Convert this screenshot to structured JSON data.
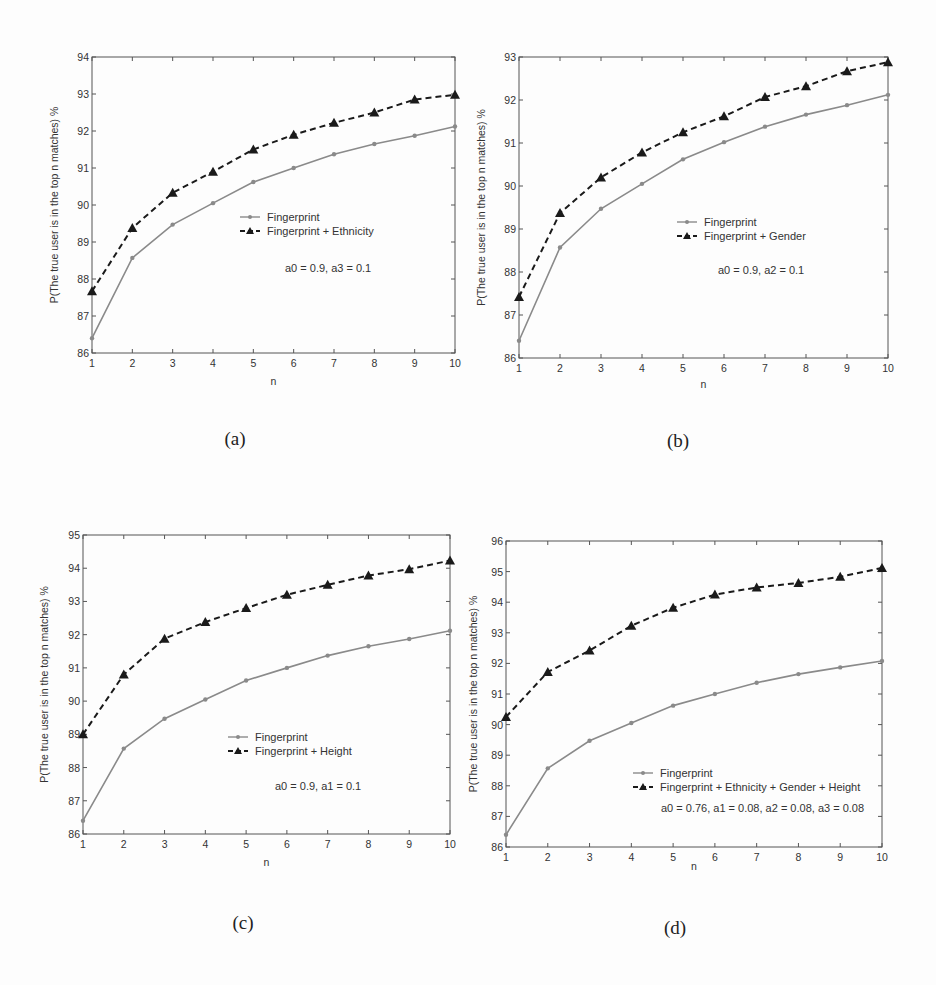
{
  "figure": {
    "panels": [
      {
        "id": "a",
        "caption": "(a)"
      },
      {
        "id": "b",
        "caption": "(b)"
      },
      {
        "id": "c",
        "caption": "(c)"
      },
      {
        "id": "d",
        "caption": "(d)"
      }
    ]
  },
  "colors": {
    "fingerprint": "#8a8a8a",
    "combined": "#1a1a1a",
    "axis": "#555555"
  },
  "chart_data": [
    {
      "type": "line",
      "panel": "(a)",
      "title": "",
      "xlabel": "n",
      "ylabel": "P(The true user is in the top n matches) %",
      "x": [
        1,
        2,
        3,
        4,
        5,
        6,
        7,
        8,
        9,
        10
      ],
      "xlim": [
        1,
        10
      ],
      "ylim": [
        86,
        94
      ],
      "yticks": [
        86,
        87,
        88,
        89,
        90,
        91,
        92,
        93,
        94
      ],
      "grid": false,
      "legend_position": "center-right",
      "annotation": "a0 = 0.9, a3 = 0.1",
      "series": [
        {
          "name": "Fingerprint",
          "style": "solid-gray-circle",
          "values": [
            86.4,
            88.57,
            89.47,
            90.05,
            90.62,
            91.0,
            91.37,
            91.65,
            91.87,
            92.12
          ]
        },
        {
          "name": "Fingerprint + Ethnicity",
          "style": "dashed-black-triangle",
          "values": [
            87.67,
            89.38,
            90.33,
            90.9,
            91.5,
            91.9,
            92.22,
            92.5,
            92.85,
            92.98
          ]
        }
      ]
    },
    {
      "type": "line",
      "panel": "(b)",
      "title": "",
      "xlabel": "n",
      "ylabel": "P(The true user is in the top n matches) %",
      "x": [
        1,
        2,
        3,
        4,
        5,
        6,
        7,
        8,
        9,
        10
      ],
      "xlim": [
        1,
        10
      ],
      "ylim": [
        86,
        93
      ],
      "yticks": [
        86,
        87,
        88,
        89,
        90,
        91,
        92,
        93
      ],
      "grid": false,
      "legend_position": "center",
      "annotation": "a0 = 0.9, a2 = 0.1",
      "series": [
        {
          "name": "Fingerprint",
          "style": "solid-gray-circle",
          "values": [
            86.4,
            88.57,
            89.47,
            90.05,
            90.62,
            91.02,
            91.38,
            91.66,
            91.88,
            92.12
          ]
        },
        {
          "name": "Fingerprint + Gender",
          "style": "dashed-black-triangle",
          "values": [
            87.42,
            89.37,
            90.2,
            90.78,
            91.25,
            91.62,
            92.07,
            92.32,
            92.67,
            92.88
          ]
        }
      ]
    },
    {
      "type": "line",
      "panel": "(c)",
      "title": "",
      "xlabel": "n",
      "ylabel": "P(The true user is in the top n matches) %",
      "x": [
        1,
        2,
        3,
        4,
        5,
        6,
        7,
        8,
        9,
        10
      ],
      "xlim": [
        1,
        10
      ],
      "ylim": [
        86,
        95
      ],
      "yticks": [
        86,
        87,
        88,
        89,
        90,
        91,
        92,
        93,
        94,
        95
      ],
      "grid": false,
      "legend_position": "center-right",
      "annotation": "a0 = 0.9, a1 = 0.1",
      "series": [
        {
          "name": "Fingerprint",
          "style": "solid-gray-circle",
          "values": [
            86.4,
            88.57,
            89.47,
            90.05,
            90.62,
            91.0,
            91.37,
            91.65,
            91.87,
            92.12
          ]
        },
        {
          "name": "Fingerprint + Height",
          "style": "dashed-black-triangle",
          "values": [
            89.0,
            90.8,
            91.88,
            92.38,
            92.8,
            93.2,
            93.5,
            93.78,
            93.97,
            94.23
          ]
        }
      ]
    },
    {
      "type": "line",
      "panel": "(d)",
      "title": "",
      "xlabel": "n",
      "ylabel": "P(The true user is in the top n matches) %",
      "x": [
        1,
        2,
        3,
        4,
        5,
        6,
        7,
        8,
        9,
        10
      ],
      "xlim": [
        1,
        10
      ],
      "ylim": [
        86,
        96
      ],
      "yticks": [
        86,
        87,
        88,
        89,
        90,
        91,
        92,
        93,
        94,
        95,
        96
      ],
      "grid": false,
      "legend_position": "lower-right",
      "annotation": "a0 = 0.76, a1 = 0.08, a2 = 0.08, a3 = 0.08",
      "series": [
        {
          "name": "Fingerprint",
          "style": "solid-gray-circle",
          "values": [
            86.4,
            88.57,
            89.47,
            90.05,
            90.62,
            91.0,
            91.37,
            91.65,
            91.87,
            92.08
          ]
        },
        {
          "name": "Fingerprint + Ethnicity + Gender + Height",
          "style": "dashed-black-triangle",
          "values": [
            90.25,
            91.72,
            92.42,
            93.23,
            93.82,
            94.25,
            94.48,
            94.63,
            94.83,
            95.12
          ]
        }
      ]
    }
  ]
}
